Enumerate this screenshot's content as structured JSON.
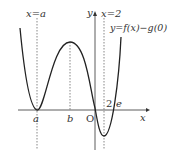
{
  "diagram": {
    "labels": {
      "x_eq_a": "x=a",
      "x_eq_2": "x=2",
      "y_axis": "y",
      "x_axis": "x",
      "curve": "y=f(x)−g(0)",
      "a": "a",
      "b": "b",
      "origin": "O",
      "two": "2",
      "e": "e"
    },
    "colors": {
      "curve": "#222222",
      "axis": "#333333",
      "dashed": "#555555"
    }
  }
}
